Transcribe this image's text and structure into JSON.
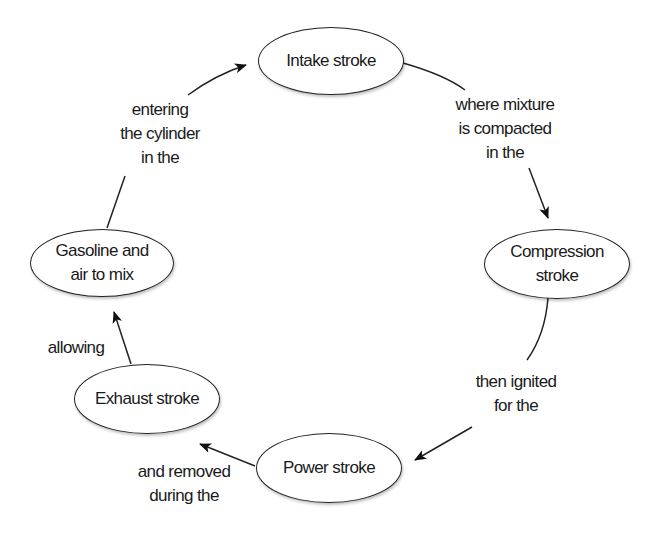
{
  "diagram": {
    "type": "cycle",
    "nodes": [
      {
        "id": "intake",
        "label": "Intake stroke"
      },
      {
        "id": "compression",
        "label": "Compression\nstroke"
      },
      {
        "id": "power",
        "label": "Power stroke"
      },
      {
        "id": "exhaust",
        "label": "Exhaust stroke"
      },
      {
        "id": "gasoline",
        "label": "Gasoline and\nair to mix"
      }
    ],
    "edges": [
      {
        "from": "intake",
        "to": "compression",
        "label": "where mixture\nis compacted\nin the"
      },
      {
        "from": "compression",
        "to": "power",
        "label": "then ignited\nfor the"
      },
      {
        "from": "power",
        "to": "exhaust",
        "label": "and removed\nduring the"
      },
      {
        "from": "exhaust",
        "to": "gasoline",
        "label": "allowing"
      },
      {
        "from": "gasoline",
        "to": "intake",
        "label": "entering\nthe cylinder\nin the"
      }
    ]
  }
}
